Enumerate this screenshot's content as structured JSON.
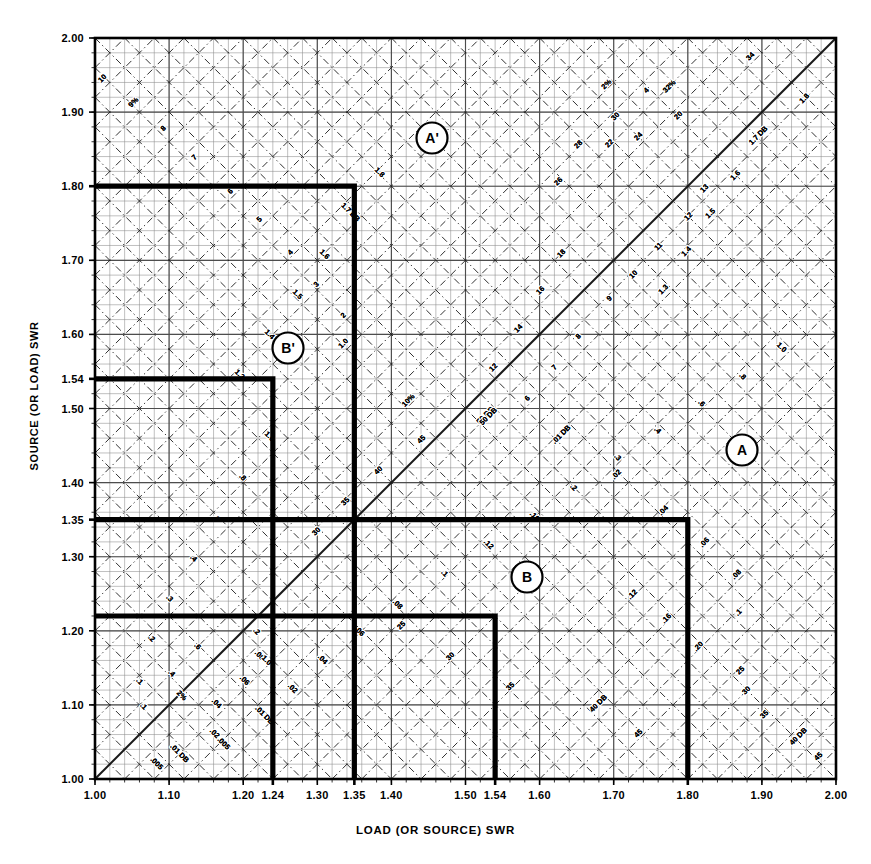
{
  "figure": {
    "xaxis_title": "LOAD (OR SOURCE) SWR",
    "yaxis_title": "SOURCE (OR LOAD) SWR"
  },
  "chart_data": {
    "type": "line",
    "xlabel": "LOAD (OR SOURCE) SWR",
    "ylabel": "SOURCE (OR LOAD) SWR",
    "xlim": [
      1.0,
      2.0
    ],
    "ylim": [
      1.0,
      2.0
    ],
    "grid": true,
    "legend_position": "none",
    "xticks": [
      "1.00",
      "1.10",
      "1.20",
      "1.24",
      "1.30",
      "1.35",
      "1.40",
      "1.50",
      "1.54",
      "1.60",
      "1.70",
      "1.80",
      "1.90",
      "2.00"
    ],
    "xtick_values": [
      1.0,
      1.1,
      1.2,
      1.24,
      1.3,
      1.35,
      1.4,
      1.5,
      1.54,
      1.6,
      1.7,
      1.8,
      1.9,
      2.0
    ],
    "yticks": [
      "1.00",
      "1.10",
      "1.20",
      "1.30",
      "1.35",
      "1.40",
      "1.50",
      "1.54",
      "1.60",
      "1.70",
      "1.80",
      "1.90",
      "2.00"
    ],
    "ytick_values": [
      1.0,
      1.1,
      1.2,
      1.3,
      1.35,
      1.4,
      1.5,
      1.54,
      1.6,
      1.7,
      1.8,
      1.9,
      2.0
    ],
    "highlight_xticks": [
      "1.24",
      "1.35",
      "1.54",
      "1.80"
    ],
    "highlight_yticks": [
      "1.35",
      "1.54",
      "1.80"
    ],
    "db_contour_labels": [
      ".005",
      ".01 DB",
      ".02",
      ".04",
      ".06",
      ".08",
      ".1",
      ".12",
      ".16",
      ".2",
      ".3",
      ".4",
      ".6",
      ".8",
      "1.0",
      "1.3",
      "1.4",
      "1.5",
      "1.6",
      "1.7 DB",
      "1.8"
    ],
    "percent_contour_labels": [
      "2%",
      "3",
      "4",
      "5",
      "6",
      "7",
      "8",
      "9%",
      "10%",
      "11",
      "12",
      "13",
      "14",
      "16",
      "18",
      "20",
      "22",
      "24",
      "25",
      "26",
      "28",
      "30",
      "32%",
      "34",
      "35",
      "40 DB",
      "45",
      "50 DB"
    ],
    "markers": [
      {
        "label": "A",
        "x": 1.8,
        "y": 1.35,
        "px": 742,
        "py": 450
      },
      {
        "label": "A'",
        "x": 1.35,
        "y": 1.8,
        "px": 432,
        "py": 138
      },
      {
        "label": "B",
        "x": 1.54,
        "y": 1.22,
        "px": 527,
        "py": 577
      },
      {
        "label": "B'",
        "x": 1.24,
        "y": 1.54,
        "px": 288,
        "py": 348
      }
    ],
    "step_curves": [
      {
        "name": "A",
        "corner_x": 1.8,
        "corner_y": 1.35
      },
      {
        "name": "A'",
        "corner_x": 1.35,
        "corner_y": 1.8
      },
      {
        "name": "B",
        "corner_x": 1.54,
        "corner_y": 1.22
      },
      {
        "name": "B'",
        "corner_x": 1.24,
        "corner_y": 1.54
      }
    ]
  },
  "colors": {
    "axis": "#000000",
    "grid_minor": "#8c8c8c",
    "grid_major": "#4d4d4d",
    "contour_dash": "#1a1a1a",
    "highlight_curve": "#000000",
    "background": "#ffffff"
  }
}
